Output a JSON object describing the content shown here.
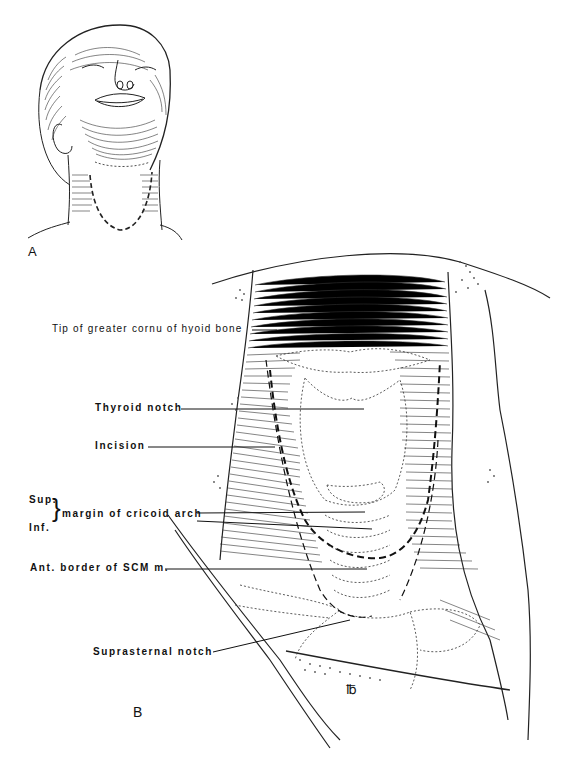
{
  "figure": {
    "panel_a_label": "A",
    "panel_b_label": "B",
    "labels": {
      "hyoid": "Tip of greater cornu of hyoid bone",
      "thyroid_notch": "Thyroid notch",
      "incision": "Incision",
      "sup": "Sup.",
      "inf": "Inf.",
      "cricoid": "margin of cricoid arch",
      "scm": "Ant. border of SCM m.",
      "suprasternal": "Suprasternal notch"
    },
    "signature": "℔"
  }
}
